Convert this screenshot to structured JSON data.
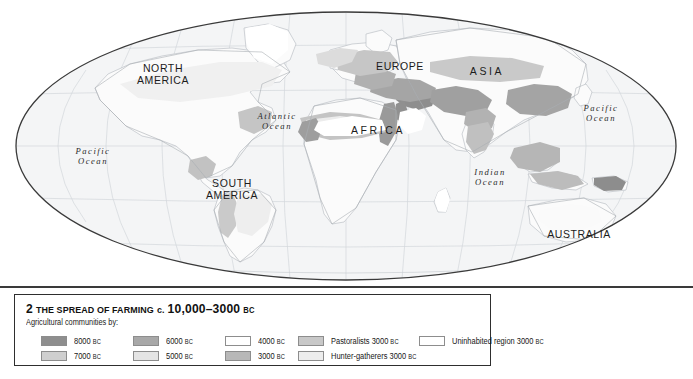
{
  "map": {
    "projection": "oval-mollweide",
    "continent_labels": [
      {
        "name": "north-america",
        "line1": "NORTH",
        "line2": "AMERICA",
        "x": 163,
        "y": 75,
        "wide": false
      },
      {
        "name": "south-america",
        "line1": "SOUTH",
        "line2": "AMERICA",
        "x": 205,
        "y": 185,
        "wide": false
      },
      {
        "name": "europe",
        "line1": "EUROPE",
        "line2": "",
        "x": 372,
        "y": 62,
        "wide": false
      },
      {
        "name": "africa",
        "line1": "AFRICA",
        "line2": "",
        "x": 355,
        "y": 128,
        "wide": true
      },
      {
        "name": "asia",
        "line1": "ASIA",
        "line2": "",
        "x": 468,
        "y": 68,
        "wide": true
      },
      {
        "name": "australia",
        "line1": "AUSTRALIA",
        "line2": "",
        "x": 550,
        "y": 230,
        "wide": false
      }
    ],
    "ocean_labels": [
      {
        "name": "pacific-ocean-west",
        "line1": "Pacific",
        "line2": "Ocean",
        "x": 70,
        "y": 150
      },
      {
        "name": "atlantic-ocean",
        "line1": "Atlantic",
        "line2": "Ocean",
        "x": 250,
        "y": 113
      },
      {
        "name": "indian-ocean",
        "line1": "Indian",
        "line2": "Ocean",
        "x": 466,
        "y": 168
      },
      {
        "name": "pacific-ocean-east",
        "line1": "Pacific",
        "line2": "Ocean",
        "x": 580,
        "y": 108
      }
    ]
  },
  "legend": {
    "number": "2",
    "title_small": "THE SPREAD OF FARMING",
    "title_c": "c.",
    "title_range": "10,000–3000",
    "title_bc": "BC",
    "subtitle": "Agricultural communities by:",
    "entries": [
      {
        "name": "legend-8000bc",
        "label": "8000",
        "era": "BC",
        "color": "#8e8e8e",
        "col": 0,
        "row": 0
      },
      {
        "name": "legend-7000bc",
        "label": "7000",
        "era": "BC",
        "color": "#cfcfcf",
        "col": 0,
        "row": 1
      },
      {
        "name": "legend-6000bc",
        "label": "6000",
        "era": "BC",
        "color": "#a8a8a8",
        "col": 1,
        "row": 0
      },
      {
        "name": "legend-5000bc",
        "label": "5000",
        "era": "BC",
        "color": "#e4e4e4",
        "col": 1,
        "row": 1
      },
      {
        "name": "legend-4000bc",
        "label": "4000",
        "era": "BC",
        "color": "#ffffff",
        "col": 2,
        "row": 0
      },
      {
        "name": "legend-3000bc",
        "label": "3000",
        "era": "BC",
        "color": "#b8b8b8",
        "col": 2,
        "row": 1
      },
      {
        "name": "legend-pastoralists",
        "label": "Pastoralists 3000",
        "era": "BC",
        "color": "#c8c8c8",
        "col": 3,
        "row": 0
      },
      {
        "name": "legend-hunter-gatherers",
        "label": "Hunter-gatherers 3000",
        "era": "BC",
        "color": "#ededed",
        "col": 3,
        "row": 1
      },
      {
        "name": "legend-uninhabited",
        "label": "Uninhabited region 3000",
        "era": "BC",
        "color": "#ffffff",
        "col": 4,
        "row": 0
      }
    ],
    "column_x": [
      26,
      118,
      210,
      283,
      404
    ],
    "row_y": [
      40,
      55
    ]
  },
  "colors": {
    "page_background": "#ffffff",
    "ocean_fill": "#f4f5f6",
    "land_fill": "#fbfbfb",
    "graticule": "#d2d6da",
    "coastline": "#b6bbc0",
    "map_outline": "#3a3a3a",
    "shade_dark": "#8e8e8e",
    "shade_mid": "#a8a8a8",
    "shade_light": "#cfcfcf",
    "shade_lighter": "#e4e4e4",
    "legend_border": "#2e2e2e",
    "text": "#1c1c1c"
  }
}
